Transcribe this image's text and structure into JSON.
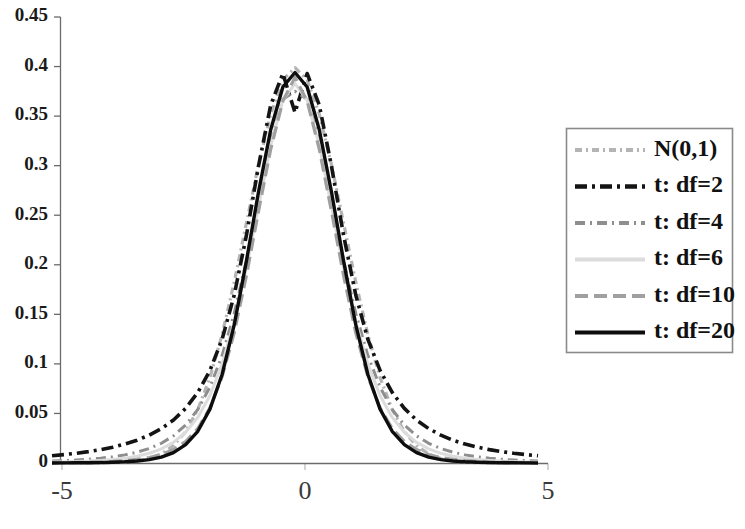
{
  "chart_data": {
    "type": "line",
    "title": "",
    "xlabel": "",
    "ylabel": "",
    "xlim": [
      -5,
      5
    ],
    "ylim": [
      0,
      0.45
    ],
    "grid": false,
    "legend_position": "right",
    "x_ticks": [
      "-5",
      "0",
      "5"
    ],
    "x_tick_values": [
      -5,
      0,
      5
    ],
    "y_ticks": [
      "0",
      "0.05",
      "0.1",
      "0.15",
      "0.2",
      "0.25",
      "0.3",
      "0.35",
      "0.4",
      "0.45"
    ],
    "y_tick_values": [
      0,
      0.05,
      0.1,
      0.15,
      0.2,
      0.25,
      0.3,
      0.35,
      0.4,
      0.45
    ],
    "x": [
      -5,
      -4.75,
      -4.5,
      -4.25,
      -4,
      -3.75,
      -3.5,
      -3.25,
      -3,
      -2.75,
      -2.5,
      -2.25,
      -2,
      -1.75,
      -1.5,
      -1.25,
      -1,
      -0.75,
      -0.5,
      -0.25,
      0,
      0.25,
      0.5,
      0.75,
      1,
      1.25,
      1.5,
      1.75,
      2,
      2.25,
      2.5,
      2.75,
      3,
      3.25,
      3.5,
      3.75,
      4,
      4.25,
      4.5,
      4.75,
      5
    ],
    "series": [
      {
        "name": "N(0,1)",
        "dist": "normal",
        "df": null,
        "peak": 0.3989,
        "color": "#b4b4b4",
        "dash": "7,4,2,4",
        "width": 3.2,
        "values": [
          1.5e-06,
          4.3e-06,
          1.6e-05,
          4.58e-05,
          0.0001338,
          0.0003757,
          0.0008727,
          0.0020374,
          0.0044318,
          0.0090937,
          0.0175283,
          0.031658,
          0.053991,
          0.0862773,
          0.1295176,
          0.1826491,
          0.2419707,
          0.3011374,
          0.3520653,
          0.3866681,
          0.3989423,
          0.3866681,
          0.3520653,
          0.3011374,
          0.2419707,
          0.1826491,
          0.1295176,
          0.0862773,
          0.053991,
          0.031658,
          0.0175283,
          0.0090937,
          0.0044318,
          0.0020374,
          0.0008727,
          0.0003757,
          0.0001338,
          4.58e-05,
          1.6e-05,
          4.3e-06,
          1.5e-06
        ]
      },
      {
        "name": "t: df=2",
        "dist": "t",
        "df": 2,
        "peak": 0.3536,
        "color": "#141414",
        "dash": "12,5,3,5",
        "width": 3.6,
        "values": [
          0.0073,
          0.0085,
          0.0098,
          0.0115,
          0.0135,
          0.016,
          0.0191,
          0.023,
          0.0281,
          0.0347,
          0.0434,
          0.0551,
          0.0712,
          0.0934,
          0.1248,
          0.1695,
          0.2296,
          0.2997,
          0.3611,
          0.393,
          0.3536,
          0.393,
          0.3611,
          0.2997,
          0.2296,
          0.1695,
          0.1248,
          0.0934,
          0.0712,
          0.0551,
          0.0434,
          0.0347,
          0.0281,
          0.023,
          0.0191,
          0.016,
          0.0135,
          0.0115,
          0.0098,
          0.0085,
          0.0073
        ]
      },
      {
        "name": "t: df=4",
        "dist": "t",
        "df": 4,
        "peak": 0.375,
        "color": "#8e8e8e",
        "dash": "10,5,2,5",
        "width": 3.0,
        "values": [
          0.002,
          0.0024,
          0.003,
          0.0038,
          0.0049,
          0.0063,
          0.0082,
          0.0109,
          0.0146,
          0.0199,
          0.0274,
          0.0383,
          0.054,
          0.0766,
          0.1084,
          0.1509,
          0.2042,
          0.2647,
          0.324,
          0.367,
          0.375,
          0.367,
          0.324,
          0.2647,
          0.2042,
          0.1509,
          0.1084,
          0.0766,
          0.054,
          0.0383,
          0.0274,
          0.0199,
          0.0146,
          0.0109,
          0.0082,
          0.0063,
          0.0049,
          0.0038,
          0.003,
          0.0024,
          0.002
        ]
      },
      {
        "name": "t: df=6",
        "dist": "t",
        "df": 6,
        "peak": 0.3827,
        "color": "#dcdcdc",
        "dash": "none",
        "width": 3.0,
        "values": [
          0.0009,
          0.0011,
          0.0015,
          0.0019,
          0.0026,
          0.0035,
          0.0048,
          0.0068,
          0.0098,
          0.0142,
          0.0209,
          0.031,
          0.046,
          0.0681,
          0.0998,
          0.1426,
          0.1968,
          0.2589,
          0.3203,
          0.3661,
          0.3827,
          0.3661,
          0.3203,
          0.2589,
          0.1968,
          0.1426,
          0.0998,
          0.0681,
          0.046,
          0.031,
          0.0209,
          0.0142,
          0.0098,
          0.0068,
          0.0048,
          0.0035,
          0.0026,
          0.0019,
          0.0015,
          0.0011,
          0.0009
        ]
      },
      {
        "name": "t: df=10",
        "dist": "t",
        "df": 10,
        "peak": 0.3891,
        "color": "#a0a0a0",
        "dash": "13,6",
        "width": 3.2,
        "values": [
          0.0003,
          0.0004,
          0.0006,
          0.0008,
          0.0011,
          0.0016,
          0.0024,
          0.0036,
          0.0055,
          0.0086,
          0.0136,
          0.0217,
          0.0348,
          0.0556,
          0.087,
          0.1315,
          0.189,
          0.2541,
          0.3165,
          0.3652,
          0.3891,
          0.3652,
          0.3165,
          0.2541,
          0.189,
          0.1315,
          0.087,
          0.0556,
          0.0348,
          0.0217,
          0.0136,
          0.0086,
          0.0055,
          0.0036,
          0.0024,
          0.0016,
          0.0011,
          0.0008,
          0.0006,
          0.0004,
          0.0003
        ]
      },
      {
        "name": "t: df=20",
        "dist": "t",
        "df": 20,
        "peak": 0.394,
        "color": "#0d0d0d",
        "dash": "none",
        "width": 3.4,
        "values": [
          7e-05,
          0.0001,
          0.0002,
          0.0003,
          0.0004,
          0.0007,
          0.0012,
          0.002,
          0.0034,
          0.006,
          0.0105,
          0.0185,
          0.032,
          0.0543,
          0.0893,
          0.1396,
          0.2037,
          0.2737,
          0.3362,
          0.3794,
          0.394,
          0.3794,
          0.3362,
          0.2737,
          0.2037,
          0.1396,
          0.0893,
          0.0543,
          0.032,
          0.0185,
          0.0105,
          0.006,
          0.0034,
          0.002,
          0.0012,
          0.0007,
          0.0004,
          0.0003,
          0.0002,
          0.0001,
          7e-05
        ]
      }
    ],
    "legend": {
      "entries": [
        "N(0,1)",
        "t: df=2",
        "t: df=4",
        "t: df=6",
        "t: df=10",
        "t: df=20"
      ],
      "border_color": "#8a8a8a",
      "background_color": "#ffffff"
    },
    "axis_color": "#6b6b6b",
    "background_color": "#ffffff"
  }
}
